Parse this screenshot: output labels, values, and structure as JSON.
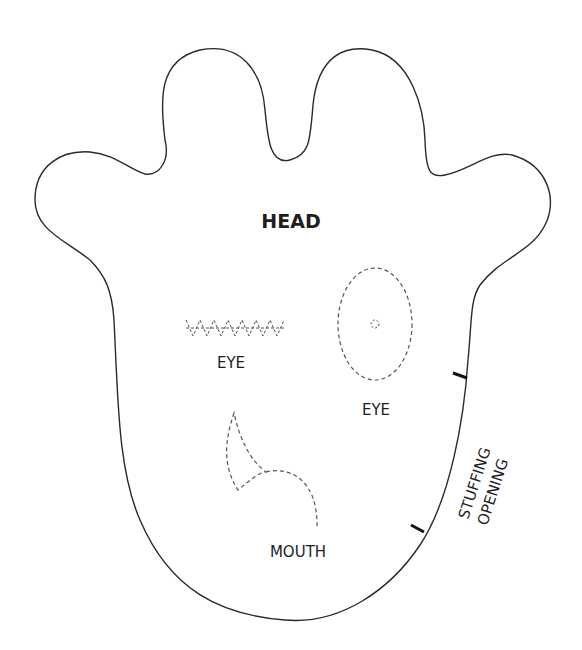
{
  "pattern": {
    "piece_name": "HEAD",
    "labels": {
      "eye_left": "EYE",
      "eye_right": "EYE",
      "mouth": "MOUTH",
      "stuffing_line1": "STUFFING",
      "stuffing_line2": "OPENING"
    },
    "colors": {
      "outline": "#2a2a2a",
      "dashed": "#555555",
      "text": "#1e1e1e",
      "background": "#ffffff"
    }
  }
}
